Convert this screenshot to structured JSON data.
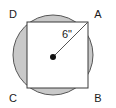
{
  "figure": {
    "background_color": "#ffffff",
    "circle": {
      "name": "shaded-circle",
      "center_x": 53,
      "center_y": 55,
      "radius": 40,
      "fill_color": "#c9c9c9",
      "stroke_color": "#555555",
      "stroke_width": 1
    },
    "square": {
      "name": "inscribed-square",
      "x": 27,
      "y": 22,
      "width": 61,
      "height": 66,
      "fill_color": "#ffffff",
      "stroke_color": "#3a3a3a",
      "stroke_width": 1
    },
    "center_point": {
      "name": "circle-center-dot",
      "cx": 53,
      "cy": 57,
      "r": 3,
      "color": "#111111"
    },
    "radius_line": {
      "name": "radius-segment",
      "x1": 53,
      "y1": 57,
      "x2": 88,
      "y2": 22,
      "color": "#555555",
      "stroke_width": 1
    },
    "radius_label": {
      "text": "6\"",
      "x": 67,
      "y": 38
    },
    "vertex_labels": [
      {
        "id": "D",
        "text": "D",
        "x": 13,
        "y": 18,
        "position": "top-left"
      },
      {
        "id": "A",
        "text": "A",
        "x": 98,
        "y": 18,
        "position": "top-right"
      },
      {
        "id": "C",
        "text": "C",
        "x": 13,
        "y": 102,
        "position": "bottom-left"
      },
      {
        "id": "B",
        "text": "B",
        "x": 98,
        "y": 102,
        "position": "bottom-right"
      }
    ]
  }
}
